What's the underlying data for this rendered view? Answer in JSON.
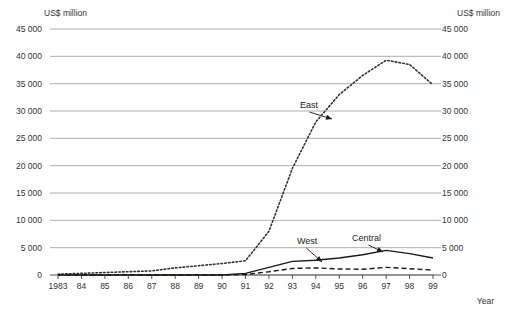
{
  "chart_data": {
    "type": "line",
    "title": "",
    "xlabel": "Year",
    "ylabel": "US$ million",
    "ylabel_right": "US$ million",
    "grid": true,
    "legend_position": "inline-annotations",
    "ylim": [
      0,
      45000
    ],
    "yticks": [
      0,
      5000,
      10000,
      15000,
      20000,
      25000,
      30000,
      35000,
      40000,
      45000
    ],
    "ytick_labels": [
      "0",
      "5 000",
      "10 000",
      "15 000",
      "20 000",
      "25 000",
      "30 000",
      "35 000",
      "40 000",
      "45 000"
    ],
    "x": [
      1983,
      1984,
      1985,
      1986,
      1987,
      1988,
      1989,
      1990,
      1991,
      1992,
      1993,
      1994,
      1995,
      1996,
      1997,
      1998,
      1999
    ],
    "xtick_labels": [
      "1983",
      "84",
      "85",
      "86",
      "87",
      "88",
      "89",
      "90",
      "91",
      "92",
      "93",
      "94",
      "95",
      "96",
      "97",
      "98",
      "99"
    ],
    "series": [
      {
        "name": "East",
        "style": "dotted",
        "color": "#333333",
        "values": [
          150,
          300,
          450,
          600,
          750,
          1300,
          1700,
          2100,
          2600,
          8000,
          19500,
          28000,
          33000,
          36500,
          39300,
          38500,
          34800
        ]
      },
      {
        "name": "Central",
        "style": "solid",
        "color": "#1a1a1a",
        "values": [
          0,
          0,
          0,
          0,
          0,
          0,
          0,
          0,
          300,
          1400,
          2500,
          2700,
          3100,
          3700,
          4500,
          3900,
          3100
        ]
      },
      {
        "name": "West",
        "style": "dashed",
        "color": "#1a1a1a",
        "values": [
          0,
          0,
          0,
          0,
          0,
          0,
          0,
          0,
          100,
          600,
          1200,
          1300,
          1100,
          1050,
          1400,
          1150,
          900
        ]
      }
    ],
    "annotations": [
      {
        "label": "East",
        "text_x": 300,
        "text_y": 100,
        "arrow_to_x": 332,
        "arrow_to_y": 119
      },
      {
        "label": "West",
        "text_x": 297,
        "text_y": 236,
        "arrow_to_x": 322,
        "arrow_to_y": 262
      },
      {
        "label": "Central",
        "text_x": 352,
        "text_y": 233,
        "arrow_to_x": 383,
        "arrow_to_y": 252
      }
    ]
  }
}
